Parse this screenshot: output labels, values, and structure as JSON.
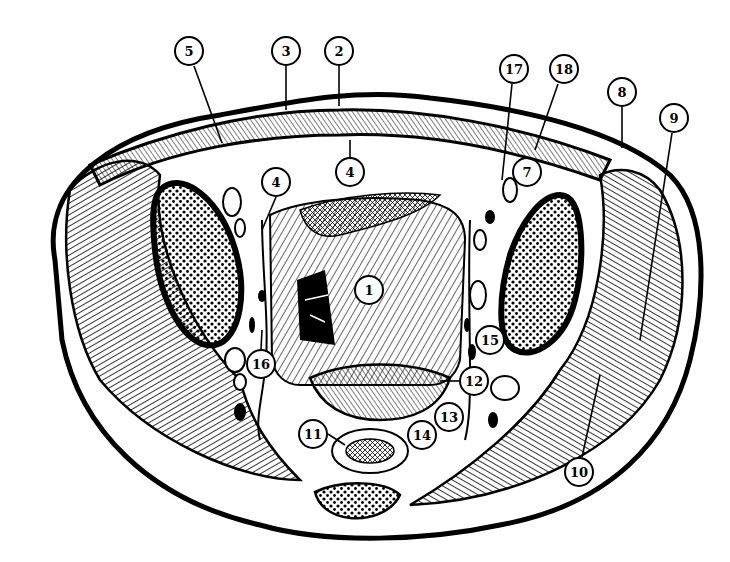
{
  "diagram": {
    "type": "anatomical cross-section line drawing (pelvis, axial)",
    "style": {
      "ink": "#000000",
      "paper": "#ffffff"
    },
    "labels": [
      {
        "id": "1",
        "text": "1",
        "x": 369,
        "y": 290
      },
      {
        "id": "2",
        "text": "2",
        "x": 339,
        "y": 51
      },
      {
        "id": "3",
        "text": "3",
        "x": 286,
        "y": 51
      },
      {
        "id": "4a",
        "text": "4",
        "x": 276,
        "y": 182
      },
      {
        "id": "4b",
        "text": "4",
        "x": 350,
        "y": 172
      },
      {
        "id": "5",
        "text": "5",
        "x": 189,
        "y": 51
      },
      {
        "id": "7",
        "text": "7",
        "x": 527,
        "y": 172
      },
      {
        "id": "8",
        "text": "8",
        "x": 622,
        "y": 92
      },
      {
        "id": "9",
        "text": "9",
        "x": 674,
        "y": 118
      },
      {
        "id": "10",
        "text": "10",
        "x": 579,
        "y": 472
      },
      {
        "id": "11",
        "text": "11",
        "x": 313,
        "y": 434
      },
      {
        "id": "12",
        "text": "12",
        "x": 474,
        "y": 381
      },
      {
        "id": "13",
        "text": "13",
        "x": 449,
        "y": 417
      },
      {
        "id": "14",
        "text": "14",
        "x": 422,
        "y": 435
      },
      {
        "id": "15",
        "text": "15",
        "x": 490,
        "y": 340
      },
      {
        "id": "16",
        "text": "16",
        "x": 261,
        "y": 364
      },
      {
        "id": "17",
        "text": "17",
        "x": 514,
        "y": 69
      },
      {
        "id": "18",
        "text": "18",
        "x": 564,
        "y": 69
      }
    ]
  }
}
